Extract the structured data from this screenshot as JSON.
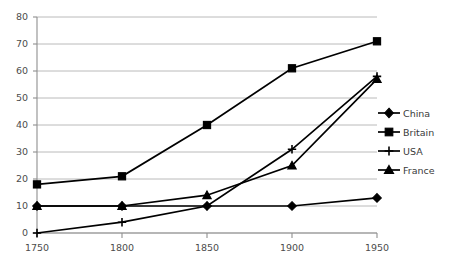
{
  "chart_data": {
    "type": "line",
    "title": "",
    "xlabel": "",
    "ylabel": "",
    "x": [
      1750,
      1800,
      1850,
      1900,
      1950
    ],
    "categories": [
      "1750",
      "1800",
      "1850",
      "1900",
      "1950"
    ],
    "xlim": [
      1750,
      1950
    ],
    "ylim": [
      0,
      80
    ],
    "y_ticks": [
      0,
      10,
      20,
      30,
      40,
      50,
      60,
      70,
      80
    ],
    "x_ticks": [
      1750,
      1800,
      1850,
      1900,
      1950
    ],
    "grid": "horizontal",
    "legend_position": "right",
    "series": [
      {
        "name": "China",
        "marker": "diamond",
        "values": [
          10,
          10,
          10,
          10,
          13
        ]
      },
      {
        "name": "Britain",
        "marker": "square",
        "values": [
          18,
          21,
          40,
          61,
          71
        ]
      },
      {
        "name": "USA",
        "marker": "cross",
        "values": [
          0,
          4,
          10,
          31,
          58
        ]
      },
      {
        "name": "France",
        "marker": "triangle",
        "values": [
          10,
          10,
          14,
          25,
          57
        ]
      }
    ],
    "colors": {
      "series": "#000000",
      "grid": "#a8a8a8",
      "axis": "#8f8f8f",
      "tick_text": "#4c4c4c",
      "legend_text": "#3a3a3a",
      "background": "#ffffff"
    }
  },
  "axis": {
    "y_tick_labels": [
      "80",
      "70",
      "60",
      "50",
      "40",
      "30",
      "20",
      "10",
      "0"
    ],
    "x_tick_labels": [
      "1750",
      "1800",
      "1850",
      "1900",
      "1950"
    ]
  },
  "legend": {
    "items": [
      {
        "label": "China"
      },
      {
        "label": "Britain"
      },
      {
        "label": "USA"
      },
      {
        "label": "France"
      }
    ]
  }
}
